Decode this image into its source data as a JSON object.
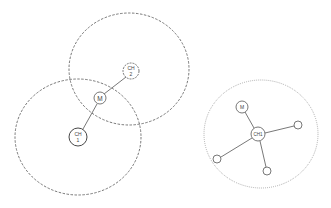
{
  "diagram": {
    "colors": {
      "line": "#555555",
      "range_dashed": "#555555",
      "range_dotted": "#888888",
      "background": "#ffffff"
    },
    "left_panel": {
      "ranges": [
        {
          "id": "range-ch2",
          "cx": 129,
          "cy": 69,
          "rx": 60,
          "ry": 56,
          "style": "dashed"
        },
        {
          "id": "range-ch1",
          "cx": 78,
          "cy": 137,
          "rx": 63,
          "ry": 58,
          "style": "dashed"
        }
      ],
      "nodes": [
        {
          "id": "ch2",
          "label_line1": "CH",
          "label_line2": "2",
          "cx": 131,
          "cy": 71,
          "r": 8,
          "style": "dashed"
        },
        {
          "id": "m",
          "label_line1": "M",
          "cx": 100,
          "cy": 98,
          "r": 6,
          "style": "solid"
        },
        {
          "id": "ch1",
          "label_line1": "CH",
          "label_line2": "1",
          "cx": 78,
          "cy": 137,
          "r": 9,
          "style": "solid"
        }
      ],
      "edges": [
        {
          "from": "ch2",
          "to": "m"
        },
        {
          "from": "m",
          "to": "ch1"
        }
      ]
    },
    "right_panel": {
      "range": {
        "id": "range-ch1-right",
        "cx": 261,
        "cy": 134,
        "rx": 57,
        "ry": 54,
        "style": "dotted"
      },
      "nodes": [
        {
          "id": "ch1",
          "label_line1": "CH1",
          "cx": 258,
          "cy": 134,
          "r": 7
        },
        {
          "id": "m",
          "label_line1": "M",
          "cx": 242,
          "cy": 107,
          "r": 6
        },
        {
          "id": "leaf-right",
          "label_line1": "",
          "cx": 298,
          "cy": 125,
          "r": 4
        },
        {
          "id": "leaf-left",
          "label_line1": "",
          "cx": 217,
          "cy": 159,
          "r": 4
        },
        {
          "id": "leaf-bottom",
          "label_line1": "",
          "cx": 267,
          "cy": 171,
          "r": 4
        }
      ],
      "edges": [
        {
          "from": "m",
          "to": "ch1"
        },
        {
          "from": "ch1",
          "to": "leaf-right"
        },
        {
          "from": "ch1",
          "to": "leaf-left"
        },
        {
          "from": "ch1",
          "to": "leaf-bottom"
        }
      ]
    }
  }
}
